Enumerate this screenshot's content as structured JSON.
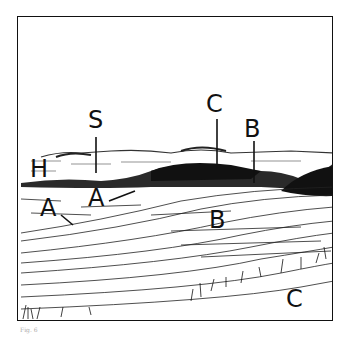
{
  "figure": {
    "type": "landscape sketch with lettered features",
    "labels": [
      {
        "id": "S",
        "text": "S",
        "x": 88,
        "y": 96
      },
      {
        "id": "H",
        "text": "H",
        "x": 32,
        "y": 157
      },
      {
        "id": "A1",
        "text": "A",
        "x": 40,
        "y": 196
      },
      {
        "id": "A2",
        "text": "A",
        "x": 88,
        "y": 186
      },
      {
        "id": "C1",
        "text": "C",
        "x": 205,
        "y": 92
      },
      {
        "id": "B1",
        "text": "B",
        "x": 244,
        "y": 117
      },
      {
        "id": "B2",
        "text": "B",
        "x": 209,
        "y": 208
      },
      {
        "id": "C2",
        "text": "C",
        "x": 286,
        "y": 285
      }
    ],
    "caption": "Fig. 6"
  }
}
